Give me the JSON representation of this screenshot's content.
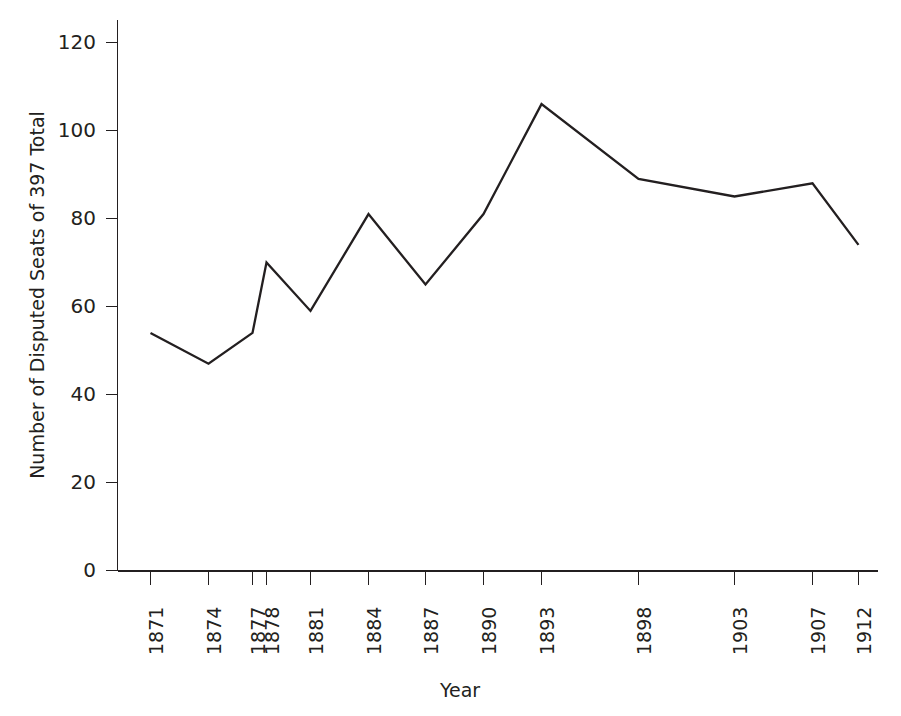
{
  "chart_data": {
    "type": "line",
    "title": "",
    "xlabel": "Year",
    "ylabel": "Number of Disputed Seats of 397 Total",
    "categories": [
      "1871",
      "1874",
      "1877",
      "1878",
      "1881",
      "1884",
      "1887",
      "1890",
      "1893",
      "1898",
      "1903",
      "1907",
      "1912"
    ],
    "values": [
      54,
      47,
      54,
      70,
      59,
      81,
      65,
      81,
      106,
      89,
      85,
      88,
      74
    ],
    "x": [
      1871,
      1874,
      1877,
      1878,
      1881,
      1884,
      1887,
      1890,
      1893,
      1898,
      1903,
      1907,
      1912
    ],
    "ylim": [
      0,
      120
    ],
    "yticks": [
      "0",
      "20",
      "40",
      "60",
      "80",
      "100",
      "120"
    ],
    "ytick_values": [
      0,
      20,
      40,
      60,
      80,
      100,
      120
    ],
    "xtick_labels": [
      "1871",
      "1874",
      "1877",
      "1878",
      "1881",
      "1884",
      "1887",
      "1890",
      "1893",
      "1898",
      "1903",
      "1907",
      "1912"
    ],
    "grid": false,
    "legend": false,
    "legend_position": "none",
    "series": [
      {
        "name": "Disputed Seats",
        "values": [
          54,
          47,
          54,
          70,
          59,
          81,
          65,
          81,
          106,
          89,
          85,
          88,
          74
        ],
        "color": "#231f20"
      }
    ],
    "line_color": "#231f20",
    "background_color": "#ffffff"
  }
}
